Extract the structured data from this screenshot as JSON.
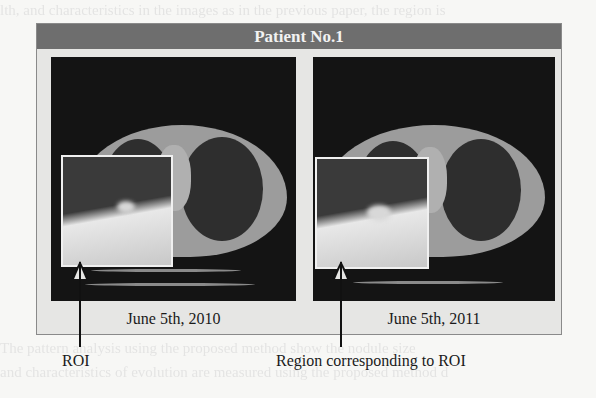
{
  "figure": {
    "title": "Patient No.1",
    "panels": [
      {
        "id": "left",
        "date": "June 5th, 2010",
        "description": "Chest CT axial slice with magnified inset of ROI"
      },
      {
        "id": "right",
        "date": "June 5th, 2011",
        "description": "Chest CT axial slice with magnified inset of corresponding region"
      }
    ],
    "annotations": [
      {
        "label": "ROI",
        "points_to": "left inset"
      },
      {
        "label": "Region corresponding to ROI",
        "points_to": "right inset"
      }
    ]
  },
  "colors": {
    "header_bg": "#6e6e6e",
    "header_text": "#f2f2f2",
    "frame_bg": "#e6e6e4",
    "image_bg": "#141414"
  }
}
